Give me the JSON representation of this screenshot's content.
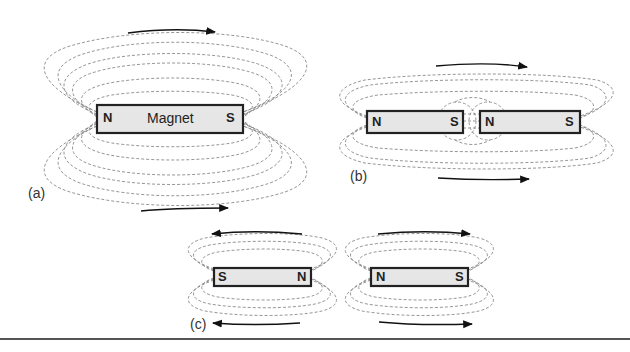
{
  "figure": {
    "colors": {
      "field_line": "#8a8a8a",
      "magnet_fill": "#e6e6e6",
      "magnet_border": "#222222",
      "arrow": "#111111",
      "rule": "#555555"
    },
    "panels": [
      {
        "id": "a",
        "label": "(a)",
        "magnets": [
          {
            "left_pole": "N",
            "right_pole": "S",
            "name": "Magnet"
          }
        ],
        "arrows": [
          "right",
          "right"
        ]
      },
      {
        "id": "b",
        "label": "(b)",
        "magnets": [
          {
            "left_pole": "N",
            "right_pole": "S"
          },
          {
            "left_pole": "N",
            "right_pole": "S"
          }
        ],
        "arrows": [
          "right",
          "right"
        ]
      },
      {
        "id": "c",
        "label": "(c)",
        "magnets": [
          {
            "left_pole": "S",
            "right_pole": "N"
          },
          {
            "left_pole": "N",
            "right_pole": "S"
          }
        ],
        "arrows": [
          "left",
          "right",
          "left",
          "right"
        ]
      }
    ]
  }
}
